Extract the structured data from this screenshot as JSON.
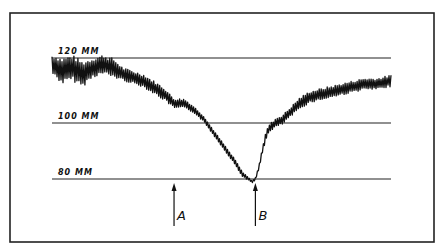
{
  "chart_data": {
    "type": "line",
    "title": "",
    "xlabel": "",
    "ylabel": "",
    "units": "mm",
    "ylim": [
      80,
      120
    ],
    "grid": false,
    "reference_lines": [
      {
        "value": 120,
        "label": "120 mm"
      },
      {
        "value": 100,
        "label": "100 mm"
      },
      {
        "value": 80,
        "label": "80 mm"
      }
    ],
    "markers": [
      {
        "label": "A",
        "x": 0.36
      },
      {
        "label": "B",
        "x": 0.6
      }
    ],
    "series": [
      {
        "name": "pressure trace",
        "x": [
          0.0,
          0.03,
          0.06,
          0.09,
          0.12,
          0.15,
          0.18,
          0.21,
          0.24,
          0.27,
          0.3,
          0.33,
          0.36,
          0.39,
          0.42,
          0.45,
          0.48,
          0.51,
          0.54,
          0.56,
          0.58,
          0.59,
          0.6,
          0.61,
          0.62,
          0.63,
          0.64,
          0.66,
          0.68,
          0.7,
          0.73,
          0.76,
          0.8,
          0.84,
          0.88,
          0.92,
          0.96,
          1.0
        ],
        "values": [
          118,
          116,
          117,
          115,
          117,
          118,
          117,
          115,
          114,
          113,
          111,
          109,
          106,
          106,
          104,
          101,
          96,
          91,
          86,
          82,
          80,
          79,
          80,
          84,
          90,
          95,
          98,
          100,
          101,
          103,
          106,
          108,
          109,
          110,
          111,
          112,
          112,
          113
        ],
        "oscillation_amplitude": [
          3,
          4,
          4,
          4,
          3,
          3,
          3,
          2,
          2,
          2,
          2,
          2,
          1.5,
          1.5,
          1,
          1,
          1,
          1,
          1,
          1,
          0.5,
          0.5,
          0.5,
          0.8,
          1,
          1.5,
          1.5,
          1.5,
          1.5,
          1.5,
          1.8,
          1.8,
          1.8,
          1.8,
          1.8,
          1.8,
          1.8,
          1.8
        ]
      }
    ]
  }
}
